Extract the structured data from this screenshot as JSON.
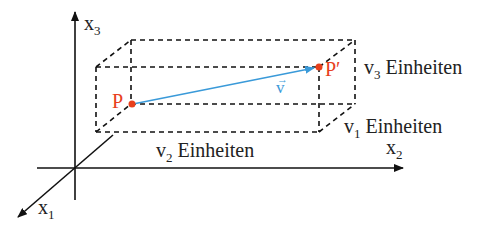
{
  "diagram": {
    "axes": {
      "x1": {
        "label": "x",
        "sub": "1"
      },
      "x2": {
        "label": "x",
        "sub": "2"
      },
      "x3": {
        "label": "x",
        "sub": "3"
      }
    },
    "points": {
      "P": {
        "label": "P"
      },
      "P_prime": {
        "label": "P′"
      }
    },
    "vector": {
      "label": "v",
      "arrow": "→"
    },
    "dimensions": {
      "v1": {
        "var": "v",
        "sub": "1",
        "unit": "Einheiten"
      },
      "v2": {
        "var": "v",
        "sub": "2",
        "unit": "Einheiten"
      },
      "v3": {
        "var": "v",
        "sub": "3",
        "unit": "Einheiten"
      }
    },
    "colors": {
      "axis": "#111111",
      "box": "#111111",
      "point": "#e8401c",
      "point_label": "#e8401c",
      "vector": "#3a9ad9",
      "text": "#222222"
    }
  }
}
